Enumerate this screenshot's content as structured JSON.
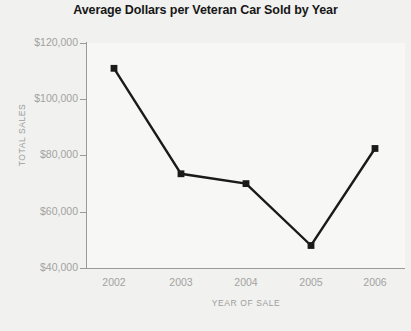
{
  "chart_data": {
    "type": "line",
    "title": "Average Dollars per Veteran Car Sold by Year",
    "xlabel": "YEAR OF SALE",
    "ylabel": "TOTAL SALES",
    "categories": [
      "2002",
      "2003",
      "2004",
      "2005",
      "2006"
    ],
    "values": [
      111000,
      73500,
      70000,
      48000,
      82500
    ],
    "series": [
      {
        "name": "Average Dollars per Veteran Car Sold",
        "values": [
          111000,
          73500,
          70000,
          48000,
          82500
        ]
      }
    ],
    "ylim": [
      40000,
      120000
    ],
    "ytick_values": [
      40000,
      60000,
      80000,
      100000,
      120000
    ],
    "ytick_labels": [
      "$40,000",
      "$60,000",
      "$80,000",
      "$100,000",
      "$120,000"
    ],
    "xtick_labels": [
      "2002",
      "2003",
      "2004",
      "2005",
      "2006"
    ],
    "grid": false,
    "legend": "none",
    "marker": "square",
    "line_color": "#1a1a1a",
    "marker_color": "#1a1a1a",
    "axis_color": "#9a9a9a",
    "tick_label_color": "#a2a2a2",
    "axis_title_color": "#9d9d9d",
    "title_color": "#171717",
    "plot_background": "#f7f7f6",
    "figure_background": "#f1f1ef"
  },
  "ytick_rows": [
    {
      "label": "$120,000"
    },
    {
      "label": "$100,000"
    },
    {
      "label": "$80,000"
    },
    {
      "label": "$60,000"
    },
    {
      "label": "$40,000"
    }
  ],
  "xtick_cols": [
    {
      "label": "2002"
    },
    {
      "label": "2003"
    },
    {
      "label": "2004"
    },
    {
      "label": "2005"
    },
    {
      "label": "2006"
    }
  ]
}
